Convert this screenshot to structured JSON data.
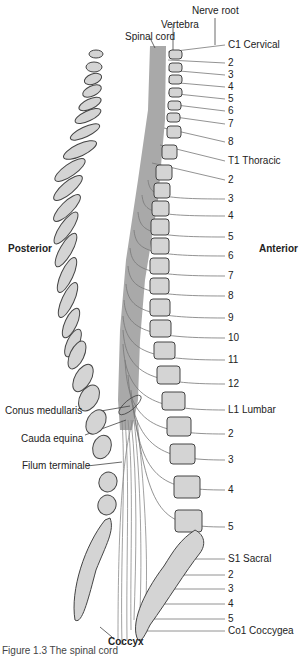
{
  "callouts": {
    "nerve_root": "Nerve root",
    "vertebra": "Vertebra",
    "spinal_cord": "Spinal cord",
    "conus_medullaris": "Conus medullaris",
    "cauda_equina": "Cauda equina",
    "filum_terminale": "Filum terminale",
    "coccyx": "Coccyx"
  },
  "orientation": {
    "posterior": "Posterior",
    "anterior": "Anterior"
  },
  "nerve_labels": [
    {
      "text": "C1 Cervical",
      "y": 45
    },
    {
      "text": "2",
      "y": 63
    },
    {
      "text": "3",
      "y": 75
    },
    {
      "text": "4",
      "y": 87
    },
    {
      "text": "5",
      "y": 99
    },
    {
      "text": "6",
      "y": 111
    },
    {
      "text": "7",
      "y": 124
    },
    {
      "text": "8",
      "y": 142
    },
    {
      "text": "T1  Thoracic",
      "y": 161
    },
    {
      "text": "2",
      "y": 180
    },
    {
      "text": "3",
      "y": 199
    },
    {
      "text": "4",
      "y": 216
    },
    {
      "text": "5",
      "y": 237
    },
    {
      "text": "6",
      "y": 256
    },
    {
      "text": "7",
      "y": 276
    },
    {
      "text": "8",
      "y": 296
    },
    {
      "text": "9",
      "y": 318
    },
    {
      "text": "10",
      "y": 338
    },
    {
      "text": "11",
      "y": 360
    },
    {
      "text": "12",
      "y": 384
    },
    {
      "text": "L1  Lumbar",
      "y": 410
    },
    {
      "text": "2",
      "y": 434
    },
    {
      "text": "3",
      "y": 460
    },
    {
      "text": "4",
      "y": 490
    },
    {
      "text": "5",
      "y": 527
    },
    {
      "text": "S1  Sacral",
      "y": 559
    },
    {
      "text": "2",
      "y": 575
    },
    {
      "text": "3",
      "y": 589
    },
    {
      "text": "4",
      "y": 604
    },
    {
      "text": "5",
      "y": 619
    },
    {
      "text": "Co1 Coccygea",
      "y": 631
    }
  ],
  "spinal_segments": [
    "C1",
    "2",
    "3",
    "4",
    "5",
    "6",
    "7",
    "8",
    "T1",
    "2",
    "3",
    "4",
    "5",
    "6",
    "7",
    "8",
    "9",
    "10",
    "11",
    "12",
    "L1",
    "2",
    "3",
    "4",
    "5",
    "S1"
  ],
  "vertebra_body_labels": [
    "C1",
    "2",
    "3",
    "4",
    "5",
    "6",
    "7",
    "T1",
    "2",
    "3",
    "4",
    "5",
    "6",
    "7",
    "8",
    "9",
    "10",
    "11",
    "12",
    "L1",
    "2",
    "3",
    "4",
    "5"
  ],
  "spinous_labels": [
    "C1",
    "2",
    "3",
    "4",
    "5",
    "6",
    "7",
    "T1",
    "2",
    "3",
    "4",
    "5",
    "6",
    "7",
    "8",
    "9",
    "10",
    "11",
    "12",
    "L1",
    "2",
    "3",
    "4",
    "5"
  ],
  "sacrum_labels": [
    "S1",
    "2",
    "3",
    "4",
    "5"
  ],
  "caption": "Figure 1.3   The spinal cord",
  "colors": {
    "bone_fill": "#d4d4d4",
    "cord_fill": "#a9a9a9",
    "line": "#555555",
    "nerve": "#777777"
  }
}
